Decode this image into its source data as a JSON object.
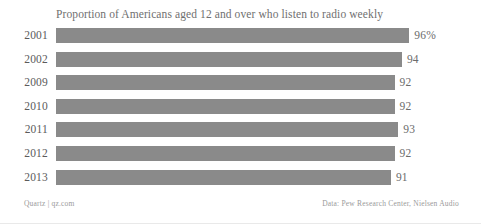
{
  "chart_data": {
    "type": "bar",
    "orientation": "horizontal",
    "title": "Proportion of Americans aged 12 and over who listen to radio weekly",
    "xlabel": "",
    "ylabel": "",
    "categories": [
      "2001",
      "2002",
      "2009",
      "2010",
      "2011",
      "2012",
      "2013"
    ],
    "values": [
      96,
      94,
      92,
      92,
      93,
      92,
      91
    ],
    "value_labels": [
      "96%",
      "94",
      "92",
      "92",
      "93",
      "92",
      "91"
    ],
    "xlim": [
      0,
      100
    ],
    "grid": false,
    "legend": null,
    "bar_color": "#8a8a8a",
    "background": "#ffffff"
  },
  "footer": {
    "left": "Quartz | qz.com",
    "right": "Data: Pew Research Center, Nielsen Audio"
  }
}
